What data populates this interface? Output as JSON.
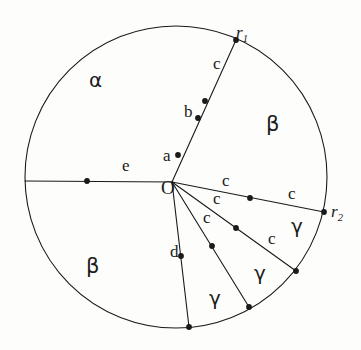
{
  "figure": {
    "kind": "geometry-diagram",
    "background_color": "#fdfdfc",
    "ink_color": "#1a1a1a",
    "stroke_width": 1.1,
    "circle": {
      "cx": 176,
      "cy": 177,
      "r": 151
    },
    "center_point": {
      "x": 172,
      "y": 182
    },
    "labels": [
      {
        "id": "r1",
        "text": "r",
        "subscript": "1",
        "x": 236,
        "y": 24,
        "size": 17,
        "style": "serif",
        "italic": true
      },
      {
        "id": "r2",
        "text": "r",
        "subscript": "2",
        "x": 331,
        "y": 203,
        "size": 17,
        "style": "serif",
        "italic": true
      },
      {
        "id": "O",
        "text": "O",
        "subscript": "",
        "x": 161,
        "y": 178,
        "size": 19,
        "style": "serif",
        "italic": false
      },
      {
        "id": "alpha",
        "text": "α",
        "subscript": "",
        "x": 89,
        "y": 70,
        "size": 20,
        "style": "greek",
        "italic": false
      },
      {
        "id": "beta1",
        "text": "β",
        "subscript": "",
        "x": 266,
        "y": 114,
        "size": 21,
        "style": "greek",
        "italic": false
      },
      {
        "id": "beta2",
        "text": "β",
        "subscript": "",
        "x": 86,
        "y": 256,
        "size": 21,
        "style": "greek",
        "italic": false
      },
      {
        "id": "e",
        "text": "e",
        "subscript": "",
        "x": 122,
        "y": 157,
        "size": 17,
        "style": "serif",
        "italic": false
      },
      {
        "id": "a",
        "text": "a",
        "subscript": "",
        "x": 163,
        "y": 147,
        "size": 17,
        "style": "serif",
        "italic": false
      },
      {
        "id": "b",
        "text": "b",
        "subscript": "",
        "x": 184,
        "y": 103,
        "size": 17,
        "style": "serif",
        "italic": false
      },
      {
        "id": "c_top",
        "text": "c",
        "subscript": "",
        "x": 213,
        "y": 55,
        "size": 17,
        "style": "serif",
        "italic": false
      },
      {
        "id": "c_r1",
        "text": "c",
        "subscript": "",
        "x": 222,
        "y": 172,
        "size": 17,
        "style": "serif",
        "italic": false
      },
      {
        "id": "c_r2",
        "text": "c",
        "subscript": "",
        "x": 288,
        "y": 185,
        "size": 17,
        "style": "serif",
        "italic": false
      },
      {
        "id": "c_r3",
        "text": "c",
        "subscript": "",
        "x": 213,
        "y": 190,
        "size": 17,
        "style": "serif",
        "italic": false
      },
      {
        "id": "c_r4",
        "text": "c",
        "subscript": "",
        "x": 268,
        "y": 230,
        "size": 17,
        "style": "serif",
        "italic": false
      },
      {
        "id": "c_r5",
        "text": "c",
        "subscript": "",
        "x": 203,
        "y": 209,
        "size": 17,
        "style": "serif",
        "italic": false
      },
      {
        "id": "d",
        "text": "d",
        "subscript": "",
        "x": 170,
        "y": 243,
        "size": 17,
        "style": "serif",
        "italic": false
      },
      {
        "id": "g1",
        "text": "γ",
        "subscript": "",
        "x": 291,
        "y": 216,
        "size": 20,
        "style": "greek",
        "italic": false
      },
      {
        "id": "g2",
        "text": "γ",
        "subscript": "",
        "x": 254,
        "y": 263,
        "size": 20,
        "style": "greek",
        "italic": false
      },
      {
        "id": "g3",
        "text": "γ",
        "subscript": "",
        "x": 209,
        "y": 288,
        "size": 20,
        "style": "greek",
        "italic": false
      }
    ],
    "rays": [
      {
        "id": "ray-e",
        "label": "e",
        "x1": 172,
        "y1": 182,
        "x2": 25,
        "y2": 181,
        "midpoint": {
          "x": 87,
          "y": 181
        }
      },
      {
        "id": "ray-r1",
        "label": "c",
        "x1": 172,
        "y1": 182,
        "x2": 236,
        "y2": 40,
        "midpoint": {
          "x": 205,
          "y": 101
        }
      },
      {
        "id": "ray-r2",
        "label": "c",
        "x1": 172,
        "y1": 182,
        "x2": 324,
        "y2": 212,
        "midpoint": {
          "x": 250,
          "y": 198
        }
      },
      {
        "id": "ray-m1",
        "label": "c",
        "x1": 172,
        "y1": 182,
        "x2": 296,
        "y2": 271,
        "midpoint": {
          "x": 236,
          "y": 228
        }
      },
      {
        "id": "ray-m2",
        "label": "c",
        "x1": 172,
        "y1": 182,
        "x2": 249,
        "y2": 307,
        "midpoint": {
          "x": 212,
          "y": 246
        }
      },
      {
        "id": "ray-d",
        "label": "d",
        "x1": 172,
        "y1": 182,
        "x2": 189,
        "y2": 327,
        "midpoint": {
          "x": 181,
          "y": 256
        }
      }
    ],
    "chord_points": [
      {
        "id": "pt-a",
        "x": 178,
        "y": 155
      },
      {
        "id": "pt-b",
        "x": 198,
        "y": 118
      }
    ],
    "dot_radius": 2.9
  }
}
